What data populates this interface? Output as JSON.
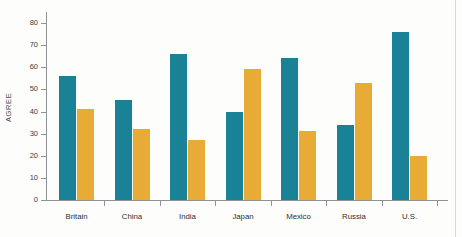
{
  "chart_data": {
    "type": "bar",
    "title": "",
    "xlabel": "",
    "ylabel": "AGREE",
    "ylim": [
      0,
      85
    ],
    "grid": false,
    "legend_position": "none",
    "categories": [
      "Britain",
      "China",
      "India",
      "Japan",
      "Mexico",
      "Russia",
      "U.S."
    ],
    "yticks": [
      0,
      10,
      20,
      30,
      40,
      50,
      60,
      70,
      80
    ],
    "ytick_labels": [
      "0",
      "10",
      "20",
      "30",
      "40",
      "50",
      "60",
      "70",
      "80"
    ],
    "series": [
      {
        "name": "teal",
        "color": "#1a8296",
        "values": [
          56,
          45,
          66,
          40,
          64,
          34,
          76
        ]
      },
      {
        "name": "gold",
        "color": "#e8ab36",
        "values": [
          41,
          32,
          27,
          59,
          31,
          53,
          20
        ]
      }
    ]
  },
  "colors": {
    "teal": "#1a8296",
    "gold": "#e8ab36",
    "axis": "#8e9296",
    "text": "#2e2e2e",
    "background": "#fdfdfc",
    "page_edge": "#d8d8d6"
  },
  "axis": {
    "y_title": "AGREE"
  }
}
